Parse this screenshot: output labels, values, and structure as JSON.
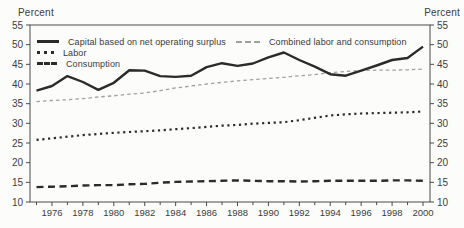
{
  "chart_data": {
    "type": "line",
    "ylabel_left": "Percent",
    "ylabel_right": "Percent",
    "x": [
      1975,
      1976,
      1977,
      1978,
      1979,
      1980,
      1981,
      1982,
      1983,
      1984,
      1985,
      1986,
      1987,
      1988,
      1989,
      1990,
      1991,
      1992,
      1993,
      1994,
      1995,
      1996,
      1997,
      1998,
      1999,
      2000
    ],
    "x_tick_years": [
      1976,
      1978,
      1980,
      1982,
      1984,
      1986,
      1988,
      1990,
      1992,
      1994,
      1996,
      1998,
      2000
    ],
    "ylim": [
      10,
      55
    ],
    "y_ticks": [
      10,
      15,
      20,
      25,
      30,
      35,
      40,
      45,
      50,
      55
    ],
    "grid": false,
    "legend_position": "top-left-and-top-right-inside",
    "frame_color": "#4a4a4a",
    "text_color": "#3d3d3d",
    "series": [
      {
        "name": "Capital based on net operating surplus",
        "style": "solid",
        "color": "#2b2b2b",
        "values": [
          38.3,
          39.5,
          42.0,
          40.5,
          38.5,
          40.3,
          43.5,
          43.4,
          42.0,
          41.8,
          42.1,
          44.3,
          45.3,
          44.6,
          45.2,
          46.8,
          48.0,
          46.1,
          44.4,
          42.5,
          42.1,
          43.4,
          44.7,
          46.1,
          46.6,
          49.5
        ]
      },
      {
        "name": "Labor",
        "style": "dotted",
        "color": "#2b2b2b",
        "values": [
          25.8,
          26.2,
          26.6,
          27.0,
          27.3,
          27.6,
          27.8,
          28.0,
          28.2,
          28.5,
          28.8,
          29.1,
          29.4,
          29.6,
          29.9,
          30.1,
          30.3,
          30.8,
          31.4,
          32.0,
          32.3,
          32.5,
          32.6,
          32.7,
          32.8,
          33.0
        ]
      },
      {
        "name": "Consumption",
        "style": "dashed",
        "color": "#2b2b2b",
        "values": [
          13.8,
          13.9,
          14.0,
          14.2,
          14.3,
          14.3,
          14.5,
          14.6,
          14.9,
          15.1,
          15.2,
          15.3,
          15.4,
          15.5,
          15.4,
          15.3,
          15.3,
          15.2,
          15.3,
          15.4,
          15.4,
          15.4,
          15.4,
          15.5,
          15.5,
          15.4
        ]
      },
      {
        "name": "Combined labor and consumption",
        "style": "finedash",
        "color": "#a0a0a0",
        "values": [
          35.5,
          35.8,
          36.0,
          36.3,
          36.7,
          37.0,
          37.4,
          37.7,
          38.3,
          39.0,
          39.5,
          40.0,
          40.4,
          40.8,
          41.1,
          41.4,
          41.7,
          42.1,
          42.4,
          42.9,
          43.2,
          43.4,
          43.5,
          43.5,
          43.6,
          43.8
        ]
      }
    ]
  }
}
